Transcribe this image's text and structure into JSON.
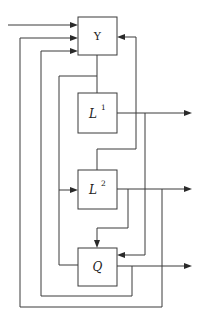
{
  "diagram": {
    "type": "block-diagram",
    "blocks": [
      {
        "id": "gamma",
        "label": "Y",
        "superscript": ""
      },
      {
        "id": "L1",
        "label": "L",
        "superscript": "1"
      },
      {
        "id": "L2",
        "label": "L",
        "superscript": "2"
      },
      {
        "id": "Q",
        "label": "Q",
        "superscript": ""
      }
    ],
    "connections": [
      {
        "from": "external-input",
        "to": "gamma",
        "arrow": true
      },
      {
        "from": "L2-output",
        "to": "gamma",
        "side": "left",
        "arrow": true,
        "note": "outer loop"
      },
      {
        "from": "Q-output",
        "to": "gamma",
        "side": "left",
        "arrow": true
      },
      {
        "from": "L2-top",
        "to": "gamma",
        "side": "right",
        "arrow": true
      },
      {
        "from": "gamma",
        "to": "L1",
        "arrow": false
      },
      {
        "from": "gamma",
        "to": "L2",
        "side": "left",
        "arrow": true
      },
      {
        "from": "gamma",
        "to": "Q",
        "side": "left",
        "arrow": false
      },
      {
        "from": "L1",
        "to": "external-output-1",
        "arrow": true
      },
      {
        "from": "L1-output",
        "to": "Q",
        "side": "right",
        "arrow": true
      },
      {
        "from": "L2",
        "to": "external-output-2",
        "arrow": true
      },
      {
        "from": "L2-output",
        "to": "Q",
        "side": "top",
        "arrow": true
      },
      {
        "from": "Q",
        "to": "external-output-3",
        "arrow": true
      }
    ]
  }
}
